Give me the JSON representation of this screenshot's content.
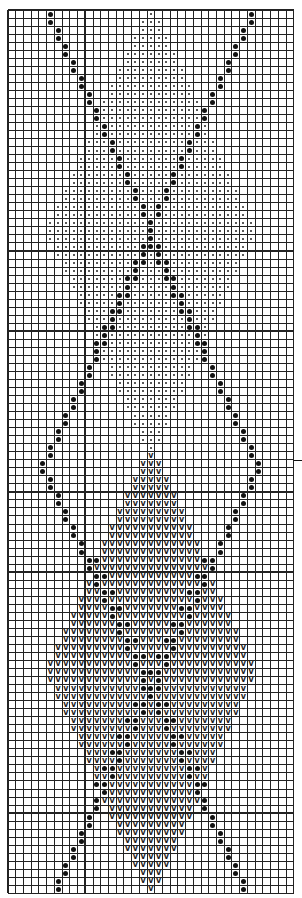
{
  "chart_title": "",
  "grid": {
    "cols": 37,
    "rows": 110,
    "cell_w": 7.72,
    "cell_h": 8.03,
    "heavy_every": 10,
    "line_color": "#222222",
    "background": "#ffffff"
  },
  "legend": {
    "small_dot": "small-dot-stitch",
    "large_dot": "large-dot-stitch",
    "v": "v-stitch"
  },
  "symbols": {
    "v_glyph": "v"
  },
  "pattern": {
    "center_col": 18,
    "top_diamond": {
      "symbol": "small_dot",
      "center_row": 27,
      "half_height": 27,
      "half_width": 13
    },
    "bottom_diamond": {
      "symbol": "v",
      "center_row": 82,
      "half_height": 27,
      "half_width": 13
    },
    "outer_lines": {
      "symbol": "large_dot",
      "rows_per_step": 2
    },
    "inner_cross": {
      "symbol": "large_dot"
    }
  },
  "row_marker": {
    "row": 56
  }
}
